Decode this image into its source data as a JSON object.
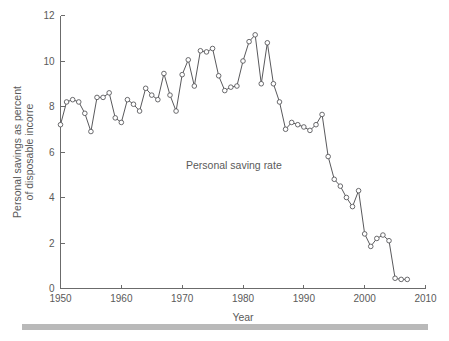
{
  "figure": {
    "background_color": "#ffffff",
    "line_color": "#59595c",
    "marker_fill": "#ffffff",
    "axis_color": "#6b6b6b",
    "text_color": "#5a5a5a",
    "footer_bar_color": "#b9b9b9"
  },
  "chart_data": {
    "type": "line",
    "title": "",
    "subtitle": "",
    "xlabel": "Year",
    "ylabel": "Personal savings as percent of disposable incorre",
    "ylabel_lines": [
      "Personal savings as percent",
      "of disposable incorre"
    ],
    "xlim": [
      1950,
      2010
    ],
    "ylim": [
      0,
      12
    ],
    "xticks": [
      1950,
      1960,
      1970,
      1980,
      1990,
      2000,
      2010
    ],
    "xtick_labels": [
      "1950",
      "1960",
      "1970",
      "1980",
      "1990",
      "2000",
      "2010"
    ],
    "yticks": [
      0,
      2,
      4,
      6,
      8,
      10,
      12
    ],
    "ytick_labels": [
      "0",
      "2",
      "4",
      "6",
      "8",
      "10",
      "12"
    ],
    "grid": false,
    "legend": false,
    "markers": "open-circle",
    "annotations": [
      {
        "text": "Personal saving rate",
        "x": 1978.5,
        "y": 5.25
      }
    ],
    "series": [
      {
        "name": "Personal saving rate",
        "x": [
          1950,
          1951,
          1952,
          1953,
          1954,
          1955,
          1956,
          1957,
          1958,
          1959,
          1960,
          1961,
          1962,
          1963,
          1964,
          1965,
          1966,
          1967,
          1968,
          1969,
          1970,
          1971,
          1972,
          1973,
          1974,
          1975,
          1976,
          1977,
          1978,
          1979,
          1980,
          1981,
          1982,
          1983,
          1984,
          1985,
          1986,
          1987,
          1988,
          1989,
          1990,
          1991,
          1992,
          1993,
          1994,
          1995,
          1996,
          1997,
          1998,
          1999,
          2000,
          2001,
          2002,
          2003,
          2004,
          2005,
          2006,
          2007
        ],
        "values": [
          7.2,
          8.2,
          8.3,
          8.2,
          7.7,
          6.9,
          8.4,
          8.4,
          8.6,
          7.5,
          7.3,
          8.3,
          8.1,
          7.8,
          8.8,
          8.5,
          8.3,
          9.45,
          8.5,
          7.8,
          9.4,
          10.05,
          8.9,
          10.45,
          10.4,
          10.55,
          9.35,
          8.7,
          8.85,
          8.9,
          10.0,
          10.85,
          11.15,
          9.0,
          10.8,
          9.0,
          8.2,
          7.0,
          7.3,
          7.2,
          7.1,
          6.95,
          7.2,
          7.65,
          5.8,
          4.8,
          4.5,
          4.0,
          3.6,
          4.3,
          2.4,
          1.85,
          2.2,
          2.35,
          2.1,
          0.45,
          0.4,
          0.4
        ]
      }
    ]
  }
}
